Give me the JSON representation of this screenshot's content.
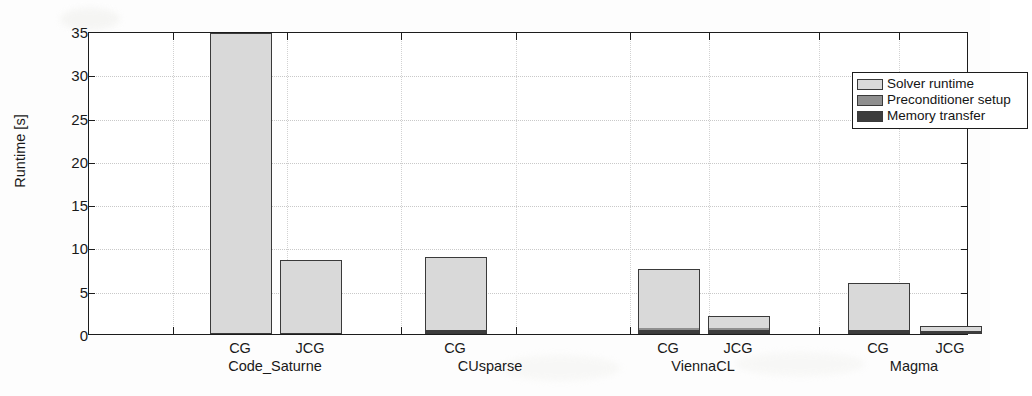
{
  "chart_data": {
    "type": "bar",
    "title": "",
    "subtitle": "",
    "xlabel": "",
    "ylabel": "Runtime [s]",
    "ylim": [
      0,
      35
    ],
    "ytick_labels": [
      "0",
      "5",
      "10",
      "15",
      "20",
      "25",
      "30",
      "35"
    ],
    "ytick_values": [
      0,
      5,
      10,
      15,
      20,
      25,
      30,
      35
    ],
    "grid": true,
    "legend_position": "top-right",
    "stacked": true,
    "legend": [
      {
        "label": "Solver runtime",
        "color": "#d9d9d9",
        "key": "solver_runtime"
      },
      {
        "label": "Preconditioner setup",
        "color": "#8f8f8f",
        "key": "preconditioner_setup"
      },
      {
        "label": "Memory transfer",
        "color": "#3d3d3d",
        "key": "memory_transfer"
      }
    ],
    "groups": [
      {
        "name": "Code_Saturne",
        "bars": [
          {
            "label": "CG",
            "memory_transfer": 0.0,
            "preconditioner_setup": 0.0,
            "solver_runtime": 34.8,
            "total": 34.8
          },
          {
            "label": "JCG",
            "memory_transfer": 0.0,
            "preconditioner_setup": 0.0,
            "solver_runtime": 8.5,
            "total": 8.5
          }
        ]
      },
      {
        "name": "CUsparse",
        "bars": [
          {
            "label": "CG",
            "memory_transfer": 0.4,
            "preconditioner_setup": 0.0,
            "solver_runtime": 8.5,
            "total": 8.9
          }
        ]
      },
      {
        "name": "ViennaCL",
        "bars": [
          {
            "label": "CG",
            "memory_transfer": 0.4,
            "preconditioner_setup": 0.2,
            "solver_runtime": 6.9,
            "total": 7.5
          },
          {
            "label": "JCG",
            "memory_transfer": 0.4,
            "preconditioner_setup": 0.3,
            "solver_runtime": 1.4,
            "total": 2.1
          }
        ]
      },
      {
        "name": "Magma",
        "bars": [
          {
            "label": "CG",
            "memory_transfer": 0.35,
            "preconditioner_setup": 0.0,
            "solver_runtime": 5.55,
            "total": 5.9
          },
          {
            "label": "JCG",
            "memory_transfer": 0.35,
            "preconditioner_setup": 0.0,
            "solver_runtime": 0.55,
            "total": 0.9
          }
        ]
      }
    ],
    "slot_centers_pct": [
      9.5,
      22.5,
      35.5,
      48.5,
      61.5,
      70.5,
      83.0,
      92.0
    ],
    "bar_layout": [
      {
        "group": 0,
        "bar": 0,
        "center_pct": 8.8,
        "width_pct": 8.7
      },
      {
        "group": 0,
        "bar": 1,
        "center_pct": 21.9,
        "width_pct": 8.7
      },
      {
        "group": 1,
        "bar": 0,
        "center_pct": 48.3,
        "width_pct": 8.7
      },
      {
        "group": 2,
        "bar": 0,
        "center_pct": 73.7,
        "width_pct": 8.7
      },
      {
        "group": 2,
        "bar": 1,
        "center_pct": 87.0,
        "width_pct": 8.7
      },
      {
        "group": 3,
        "bar": 0,
        "center_pct": 60.0,
        "width_pct": 8.7
      },
      {
        "group": 3,
        "bar": 1,
        "center_pct": 96.0,
        "width_pct": 8.7
      }
    ]
  }
}
